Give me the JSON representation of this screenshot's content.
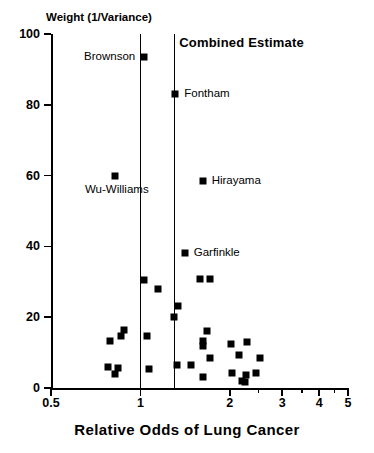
{
  "chart_data": {
    "type": "scatter",
    "title": "",
    "xlabel": "Relative Odds of Lung Cancer",
    "ylabel": "Weight (1/Variance)",
    "xscale": "log",
    "xlim": [
      0.5,
      5
    ],
    "ylim": [
      0,
      100
    ],
    "grid": false,
    "legend": "none",
    "xticks": [
      {
        "value": 0.5,
        "label": "0.5",
        "type": "major"
      },
      {
        "value": 1,
        "label": "1",
        "type": "major"
      },
      {
        "value": 2,
        "label": "2",
        "type": "major"
      },
      {
        "value": 3,
        "label": "3",
        "type": "major"
      },
      {
        "value": 4,
        "label": "4",
        "type": "major"
      },
      {
        "value": 5,
        "label": "5",
        "type": "major"
      }
    ],
    "xminorticks": [
      2.5,
      3.5,
      4.5
    ],
    "yticks": [
      {
        "value": 0,
        "label": "0"
      },
      {
        "value": 20,
        "label": "20"
      },
      {
        "value": 40,
        "label": "40"
      },
      {
        "value": 60,
        "label": "60"
      },
      {
        "value": 80,
        "label": "80"
      },
      {
        "value": 100,
        "label": "100"
      }
    ],
    "reference_lines": [
      {
        "name": "null-effect-line",
        "x": 1.0,
        "label": ""
      },
      {
        "name": "combined-estimate-line",
        "x": 1.3,
        "label": "Combined Estimate"
      }
    ],
    "annotations": [
      {
        "name": "combined-estimate-label",
        "text": "Combined Estimate",
        "x": 1.33,
        "y": 97.5,
        "align": "left"
      }
    ],
    "points": [
      {
        "name": "Brownson",
        "x": 1.03,
        "y": 93.5,
        "label": "Brownson",
        "label_pos": "left"
      },
      {
        "name": "Fontham",
        "x": 1.31,
        "y": 83.0,
        "label": "Fontham",
        "label_pos": "right"
      },
      {
        "name": "Wu-Williams",
        "x": 0.82,
        "y": 59.8,
        "label": "Wu-Williams",
        "label_pos": "below"
      },
      {
        "name": "Hirayama",
        "x": 1.62,
        "y": 58.4,
        "label": "Hirayama",
        "label_pos": "right"
      },
      {
        "name": "Garfinkle",
        "x": 1.41,
        "y": 38.0,
        "label": "Garfinkle",
        "label_pos": "right"
      },
      {
        "name": "study-06",
        "x": 1.03,
        "y": 30.5,
        "label": "",
        "label_pos": ""
      },
      {
        "name": "study-07",
        "x": 1.15,
        "y": 28.0,
        "label": "",
        "label_pos": ""
      },
      {
        "name": "study-08",
        "x": 1.59,
        "y": 30.8,
        "label": "",
        "label_pos": ""
      },
      {
        "name": "study-09",
        "x": 1.72,
        "y": 30.8,
        "label": "",
        "label_pos": ""
      },
      {
        "name": "study-10",
        "x": 1.34,
        "y": 23.3,
        "label": "",
        "label_pos": ""
      },
      {
        "name": "study-11",
        "x": 1.3,
        "y": 20.0,
        "label": "",
        "label_pos": ""
      },
      {
        "name": "study-12",
        "x": 0.88,
        "y": 16.3,
        "label": "",
        "label_pos": ""
      },
      {
        "name": "study-13",
        "x": 1.05,
        "y": 14.6,
        "label": "",
        "label_pos": ""
      },
      {
        "name": "study-14",
        "x": 1.68,
        "y": 16.0,
        "label": "",
        "label_pos": ""
      },
      {
        "name": "study-15",
        "x": 0.79,
        "y": 13.2,
        "label": "",
        "label_pos": ""
      },
      {
        "name": "study-16",
        "x": 1.62,
        "y": 13.2,
        "label": "",
        "label_pos": ""
      },
      {
        "name": "study-17",
        "x": 1.63,
        "y": 11.8,
        "label": "",
        "label_pos": ""
      },
      {
        "name": "study-18",
        "x": 2.02,
        "y": 12.4,
        "label": "",
        "label_pos": ""
      },
      {
        "name": "study-19",
        "x": 0.86,
        "y": 14.7,
        "label": "",
        "label_pos": ""
      },
      {
        "name": "study-20",
        "x": 2.14,
        "y": 9.3,
        "label": "",
        "label_pos": ""
      },
      {
        "name": "study-21",
        "x": 1.72,
        "y": 8.6,
        "label": "",
        "label_pos": ""
      },
      {
        "name": "study-22",
        "x": 2.28,
        "y": 12.9,
        "label": "",
        "label_pos": ""
      },
      {
        "name": "study-23",
        "x": 2.53,
        "y": 8.5,
        "label": "",
        "label_pos": ""
      },
      {
        "name": "study-24",
        "x": 0.78,
        "y": 6.0,
        "label": "",
        "label_pos": ""
      },
      {
        "name": "study-25",
        "x": 0.84,
        "y": 5.7,
        "label": "",
        "label_pos": ""
      },
      {
        "name": "study-26",
        "x": 0.82,
        "y": 4.0,
        "label": "",
        "label_pos": ""
      },
      {
        "name": "study-27",
        "x": 1.07,
        "y": 5.3,
        "label": "",
        "label_pos": ""
      },
      {
        "name": "study-28",
        "x": 1.33,
        "y": 6.6,
        "label": "",
        "label_pos": ""
      },
      {
        "name": "study-29",
        "x": 1.48,
        "y": 6.6,
        "label": "",
        "label_pos": ""
      },
      {
        "name": "study-30",
        "x": 1.63,
        "y": 3.1,
        "label": "",
        "label_pos": ""
      },
      {
        "name": "study-31",
        "x": 2.03,
        "y": 4.1,
        "label": "",
        "label_pos": ""
      },
      {
        "name": "study-32",
        "x": 2.19,
        "y": 2.1,
        "label": "",
        "label_pos": ""
      },
      {
        "name": "study-33",
        "x": 2.26,
        "y": 3.6,
        "label": "",
        "label_pos": ""
      },
      {
        "name": "study-34",
        "x": 2.25,
        "y": 1.6,
        "label": "",
        "label_pos": ""
      },
      {
        "name": "study-35",
        "x": 2.45,
        "y": 4.3,
        "label": "",
        "label_pos": ""
      }
    ]
  },
  "colors": {
    "axis": "#000000",
    "marker": "#000000",
    "reference_line": "#000000",
    "background": "#ffffff"
  }
}
